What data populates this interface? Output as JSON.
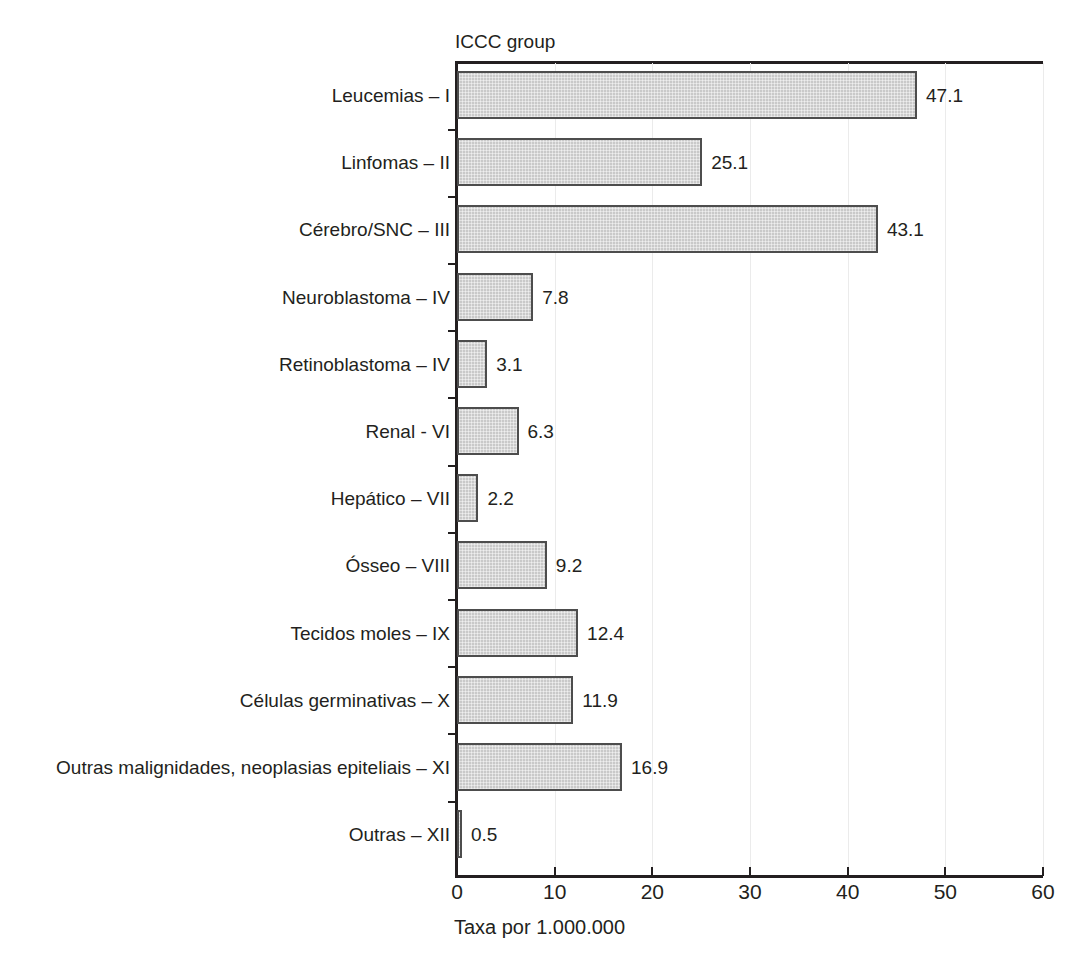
{
  "chart_data": {
    "type": "bar",
    "orientation": "horizontal",
    "title": "",
    "ylabel": "ICCC group",
    "xlabel": "Taxa por 1.000.000",
    "xlim": [
      0,
      60
    ],
    "xticks": [
      0,
      10,
      20,
      30,
      40,
      50,
      60
    ],
    "xtick_labels": [
      "0",
      "10",
      "20",
      "30",
      "40",
      "50",
      "60"
    ],
    "grid": "vertical-light",
    "legend": "none",
    "bar_fill_color": "#c9c9c9",
    "bar_edge_color": "#4d4d4d",
    "axis_color": "#231f20",
    "gridline_color": "#ebebeb",
    "categories": [
      "Leucemias – I",
      "Linfomas – II",
      "Cérebro/SNC – III",
      "Neuroblastoma – IV",
      "Retinoblastoma – IV",
      "Renal - VI",
      "Hepático – VII",
      "Ósseo – VIII",
      "Tecidos moles – IX",
      "Células germinativas – X",
      "Outras malignidades, neoplasias epiteliais – XI",
      "Outras – XII"
    ],
    "values": [
      47.1,
      25.1,
      43.1,
      7.8,
      3.1,
      6.3,
      2.2,
      9.2,
      12.4,
      11.9,
      16.9,
      0.5
    ],
    "value_labels": [
      "47.1",
      "25.1",
      "43.1",
      "7.8",
      "3.1",
      "6.3",
      "2.2",
      "9.2",
      "12.4",
      "11.9",
      "16.9",
      "0.5"
    ]
  }
}
